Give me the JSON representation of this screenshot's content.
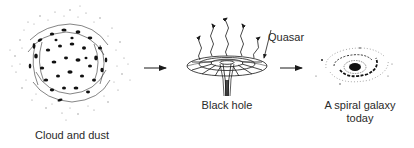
{
  "diagram": {
    "stages": [
      {
        "id": "cloud",
        "label": "Cloud and dust"
      },
      {
        "id": "blackhole",
        "label": "Black hole",
        "annotation": "Quasar"
      },
      {
        "id": "galaxy",
        "label_line1": "A spiral galaxy",
        "label_line2": "today"
      }
    ],
    "arrows": [
      {
        "from": "cloud",
        "to": "blackhole"
      },
      {
        "from": "blackhole",
        "to": "galaxy"
      }
    ],
    "colors": {
      "ink": "#1a1a1a",
      "background": "#ffffff"
    }
  }
}
